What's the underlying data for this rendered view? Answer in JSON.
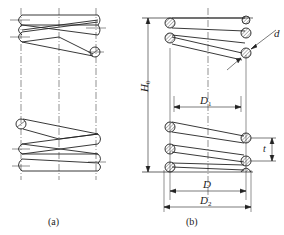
{
  "figure": {
    "panels": [
      {
        "id": "a",
        "caption": "(a)",
        "description": "Helical spring, simplified view with end coils"
      },
      {
        "id": "b",
        "caption": "(b)",
        "description": "Helical compression spring, sectional view with dimensions"
      }
    ],
    "dimensions": {
      "free_height": {
        "symbol": "H",
        "subscript": "0"
      },
      "inner_diameter": {
        "symbol": "D",
        "subscript": "1"
      },
      "mean_diameter": {
        "symbol": "D",
        "subscript": ""
      },
      "outer_diameter": {
        "symbol": "D",
        "subscript": "2"
      },
      "wire_diameter": {
        "symbol": "d",
        "subscript": ""
      },
      "pitch": {
        "symbol": "t",
        "subscript": ""
      }
    },
    "colors": {
      "line": "#222222",
      "background": "#ffffff"
    }
  }
}
